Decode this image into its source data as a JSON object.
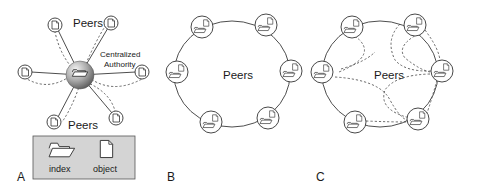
{
  "panels": {
    "a": {
      "letter": "A",
      "peers_label_top": "Peers",
      "peers_label_bottom": "Peers",
      "authority_label_line1": "Centralized",
      "authority_label_line2": "Authority",
      "legend": {
        "index_label": "index",
        "object_label": "object",
        "background": "#d4d4d4"
      }
    },
    "b": {
      "letter": "B",
      "peers_label": "Peers"
    },
    "c": {
      "letter": "C",
      "peers_label": "Peers"
    }
  },
  "icons": {
    "index": "folder-icon",
    "object": "document-icon"
  },
  "colors": {
    "stroke": "#3a3a3a",
    "sphere_light": "#f0f0f0",
    "sphere_dark": "#6a6a6a"
  }
}
